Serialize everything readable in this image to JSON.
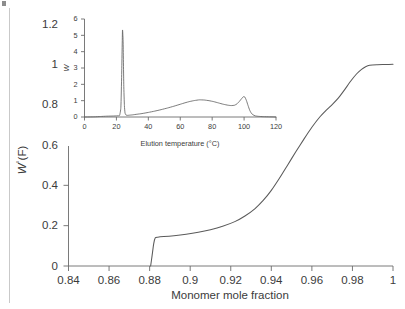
{
  "figure": {
    "name": "cumulative-comonomer-distribution-figure",
    "background_color": "#ffffff",
    "line_color": "#5a5a5a",
    "axis_color": "#6b6b6b",
    "text_color": "#3b3b3b"
  },
  "chart_data": [
    {
      "id": "main",
      "type": "line",
      "title": "",
      "xlabel": "Monomer mole fraction",
      "ylabel": "W°(F)",
      "ylabel_parts": {
        "symbol": "W",
        "superscript": "°",
        "suffix": "(F)"
      },
      "xlim": [
        0.84,
        1.0
      ],
      "ylim": [
        0,
        1.2
      ],
      "xticks": [
        0.84,
        0.86,
        0.88,
        0.9,
        0.92,
        0.94,
        0.96,
        0.98,
        1
      ],
      "xticklabels": [
        "0.84",
        "0.86",
        "0.88",
        "0.9",
        "0.92",
        "0.94",
        "0.96",
        "0.98",
        "1"
      ],
      "yticks": [
        0,
        0.2,
        0.4,
        0.6,
        0.8,
        1,
        1.2
      ],
      "yticklabels": [
        "0",
        "0.2",
        "0.4",
        "0.6",
        "0.8",
        "1",
        "1.2"
      ],
      "grid": false,
      "legend": false,
      "x": [
        0.8805,
        0.8812,
        0.882,
        0.8828,
        0.884,
        0.887,
        0.892,
        0.898,
        0.904,
        0.91,
        0.916,
        0.922,
        0.927,
        0.932,
        0.936,
        0.94,
        0.944,
        0.948,
        0.952,
        0.956,
        0.96,
        0.964,
        0.967,
        0.97,
        0.973,
        0.976,
        0.979,
        0.982,
        0.9845,
        0.9865,
        0.9885,
        0.992,
        0.996,
        1.0
      ],
      "y": [
        0.0,
        0.05,
        0.11,
        0.14,
        0.143,
        0.146,
        0.15,
        0.157,
        0.167,
        0.18,
        0.197,
        0.22,
        0.248,
        0.285,
        0.325,
        0.375,
        0.435,
        0.5,
        0.565,
        0.628,
        0.688,
        0.74,
        0.772,
        0.8,
        0.832,
        0.872,
        0.915,
        0.952,
        0.975,
        0.988,
        0.995,
        0.998,
        0.999,
        1.0
      ]
    },
    {
      "id": "inset",
      "type": "line",
      "title": "",
      "xlabel": "Elution temperature (°C)",
      "ylabel": "W",
      "xlim": [
        0,
        120
      ],
      "ylim": [
        0,
        6
      ],
      "xticks": [
        0,
        20,
        40,
        60,
        80,
        100,
        120
      ],
      "xticklabels": [
        "0",
        "20",
        "40",
        "60",
        "80",
        "100",
        "120"
      ],
      "yticks": [
        0,
        1,
        2,
        3,
        4,
        5,
        6
      ],
      "yticklabels": [
        "0",
        "1",
        "2",
        "3",
        "4",
        "5",
        "6"
      ],
      "grid": false,
      "legend": false,
      "x": [
        0,
        6,
        10,
        14,
        18,
        20,
        21,
        22,
        22.8,
        23.3,
        23.8,
        24.2,
        24.6,
        25.0,
        25.4,
        26.0,
        27.0,
        28.0,
        30.0,
        33.0,
        36.0,
        40.0,
        44.0,
        48.0,
        52.0,
        56.0,
        60.0,
        63.0,
        66.0,
        69.0,
        72.0,
        75.0,
        78.0,
        81.0,
        84.0,
        87.0,
        90.0,
        92.0,
        94.0,
        95.5,
        97.0,
        98.5,
        99.5,
        100.5,
        101.5,
        102.5,
        103.5,
        104.5,
        105.5,
        107.0,
        109.0,
        112.0,
        116.0,
        120.0
      ],
      "y": [
        0.0,
        0.01,
        0.03,
        0.05,
        0.06,
        0.07,
        0.08,
        0.1,
        0.6,
        2.6,
        5.3,
        4.6,
        2.0,
        0.7,
        0.25,
        0.12,
        0.1,
        0.11,
        0.13,
        0.17,
        0.21,
        0.28,
        0.36,
        0.45,
        0.55,
        0.66,
        0.78,
        0.87,
        0.95,
        1.01,
        1.05,
        1.04,
        1.0,
        0.94,
        0.86,
        0.78,
        0.72,
        0.7,
        0.72,
        0.8,
        0.95,
        1.13,
        1.24,
        1.22,
        1.0,
        0.7,
        0.42,
        0.24,
        0.14,
        0.07,
        0.04,
        0.02,
        0.01,
        0.0
      ]
    }
  ]
}
